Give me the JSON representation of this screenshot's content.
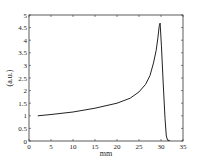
{
  "chart_data": {
    "type": "line",
    "title": "",
    "xlabel": "mm",
    "ylabel": "(a.u.)",
    "xlim": [
      0,
      35
    ],
    "ylim": [
      0,
      5
    ],
    "xticks": [
      0,
      5,
      10,
      15,
      20,
      25,
      30,
      35
    ],
    "yticks": [
      0,
      0.5,
      1,
      1.5,
      2,
      2.5,
      3,
      3.5,
      4,
      4.5,
      5
    ],
    "grid": false,
    "legend": null,
    "series": [
      {
        "name": "profile",
        "color": "#222222",
        "x": [
          2,
          5,
          10,
          15,
          20,
          23,
          25,
          26.5,
          27.5,
          28.3,
          28.9,
          29.3,
          29.6,
          29.8,
          30.1,
          30.5,
          30.9,
          31.2,
          31.5,
          32
        ],
        "y": [
          1.0,
          1.05,
          1.15,
          1.3,
          1.5,
          1.7,
          1.95,
          2.25,
          2.6,
          3.1,
          3.6,
          4.1,
          4.55,
          4.68,
          3.8,
          2.3,
          0.9,
          0.2,
          0.03,
          0.02
        ]
      }
    ]
  }
}
